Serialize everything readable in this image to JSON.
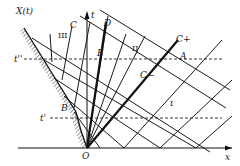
{
  "figure": {
    "type": "characteristics x-t diagram (piston-driven flow)",
    "axes": {
      "x_label": "x",
      "t_label": "t",
      "origin_label": "O",
      "piston_label": "X(t)"
    },
    "time_levels": [
      {
        "label": "t''",
        "name": "t-double-prime"
      },
      {
        "label": "t'",
        "name": "t-prime"
      }
    ],
    "points": {
      "A": "A",
      "B": "B",
      "C_top": "C",
      "D": "D",
      "E": "E"
    },
    "characteristic_labels": {
      "c_plus": "C+",
      "c_minus": "C−"
    },
    "regions": {
      "I": "I",
      "II": "II",
      "III": "III"
    },
    "colors": {
      "ink": "#1a1a1a",
      "background": "#ffffff"
    }
  }
}
